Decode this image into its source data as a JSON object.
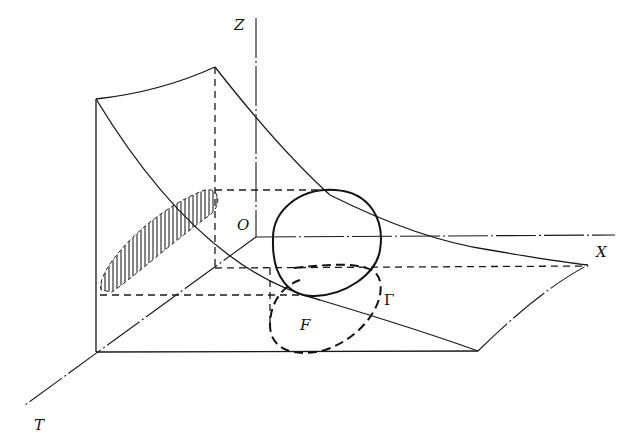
{
  "figure": {
    "type": "3d-surface-projection-diagram",
    "axes": {
      "z_label": "Z",
      "x_label": "X",
      "t_label": "T",
      "origin_label": "O"
    },
    "curve_labels": {
      "gamma": "Γ",
      "region": "F"
    },
    "colors": {
      "ink": "#1a1a1a",
      "background": "#ffffff"
    }
  }
}
